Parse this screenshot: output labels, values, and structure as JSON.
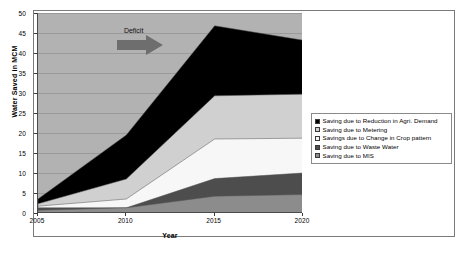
{
  "chart_data": {
    "type": "area",
    "stacked": true,
    "title": "",
    "xlabel": "Year",
    "ylabel": "Water Saved in MCM",
    "categories": [
      "2005",
      "2010",
      "2015",
      "2020"
    ],
    "x": [
      2005,
      2010,
      2015,
      2020
    ],
    "xlim": [
      2005,
      2020
    ],
    "ylim": [
      0,
      50
    ],
    "ytick_labels": [
      "0",
      "5",
      "10",
      "15",
      "20",
      "25",
      "30",
      "35",
      "40",
      "45",
      "50"
    ],
    "ytick_values": [
      0,
      5,
      10,
      15,
      20,
      25,
      30,
      35,
      40,
      45,
      50
    ],
    "xtick_labels": [
      "2005",
      "2010",
      "2015",
      "2020"
    ],
    "grid": true,
    "plot_background": "#b2b2b2",
    "legend_position": "right",
    "series": [
      {
        "name": "Saving due to Reduction in Agri. Demand",
        "color": "#000000",
        "values": [
          1.2,
          11.0,
          17.5,
          13.5
        ],
        "cumulative_top": [
          3.5,
          19.5,
          46.8,
          43.2
        ]
      },
      {
        "name": "Saving due to Metering",
        "color": "#d0d0d0",
        "values": [
          0.6,
          5.0,
          10.8,
          11.0
        ],
        "cumulative_top": [
          2.3,
          8.5,
          29.3,
          29.7
        ]
      },
      {
        "name": "Savings due to Change in Crop pattern",
        "color": "#f7f7f7",
        "values": [
          0.4,
          3.4,
          9.9,
          8.7
        ],
        "cumulative_top": [
          1.7,
          3.5,
          18.5,
          18.7
        ]
      },
      {
        "name": "Saving due to Waste Water",
        "color": "#4d4d4d",
        "values": [
          0.6,
          2.2,
          4.4,
          5.4
        ],
        "cumulative_top": [
          1.3,
          1.3,
          8.6,
          10.0
        ]
      },
      {
        "name": "Saving due to MIS",
        "color": "#8c8c8c",
        "values": [
          0.7,
          1.3,
          4.2,
          4.6
        ],
        "cumulative_top": [
          0.7,
          1.3,
          4.2,
          4.6
        ]
      }
    ],
    "annotations": [
      {
        "text": "Deficit",
        "x": 2010.6,
        "y": 45.5,
        "arrow": "right-arrow",
        "arrow_color": "#6e6e6e"
      }
    ]
  },
  "legend": {
    "items": [
      {
        "label": "Saving due to Reduction in Agri. Demand",
        "color": "#000000"
      },
      {
        "label": "Saving due to Metering",
        "color": "#d0d0d0"
      },
      {
        "label": "Savings due to Change in Crop pattern",
        "color": "#f7f7f7"
      },
      {
        "label": "Saving due to Waste Water",
        "color": "#4d4d4d"
      },
      {
        "label": "Saving due to MIS",
        "color": "#8c8c8c"
      }
    ]
  },
  "axes": {
    "x_title": "Year",
    "y_title": "Water Saved in MCM"
  }
}
